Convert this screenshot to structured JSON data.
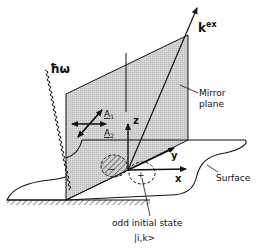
{
  "diagram": {
    "type": "physics-schematic",
    "labels": {
      "photon": "ħω",
      "k_vector_base": "k",
      "k_vector_sup": "ex",
      "mirror_plane_line1": "Mirror",
      "mirror_plane_line2": "plane",
      "polarization_1": "A",
      "polarization_1_sub": "1",
      "polarization_2": "A",
      "polarization_2_sub": "2",
      "axis_z": "z",
      "axis_y": "y",
      "axis_x": "x",
      "surface": "Surface",
      "initial_state_line1": "odd initial state",
      "initial_state_line2": "|i,k>",
      "lobe_minus": "−",
      "lobe_plus": "+"
    },
    "colors": {
      "ink": "#111111",
      "plane_fill": "#cfcfcf",
      "background": "#ffffff"
    }
  }
}
